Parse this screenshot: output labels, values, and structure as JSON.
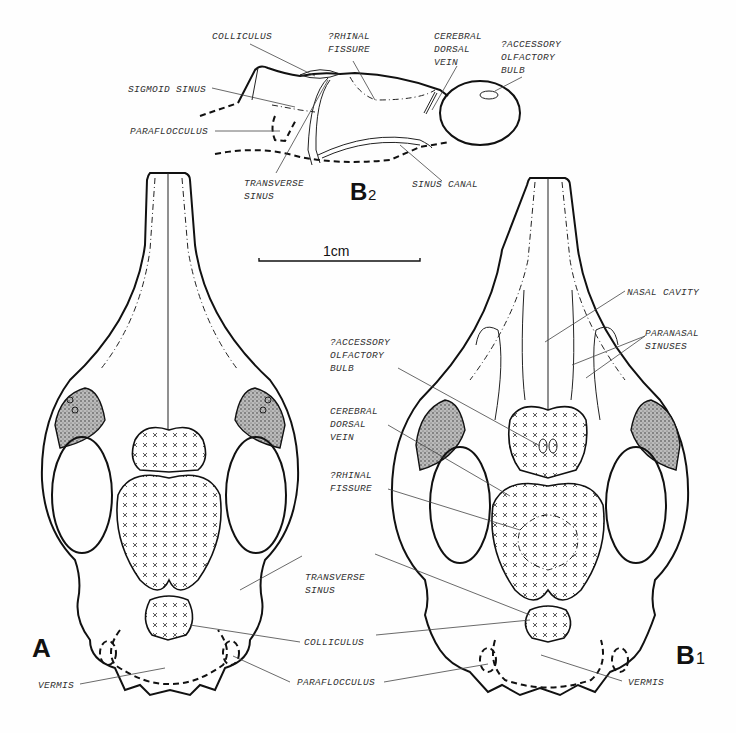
{
  "figure": {
    "panels": {
      "A": {
        "label": "A",
        "view": "dorsal"
      },
      "B1": {
        "label": "B",
        "subscript": "1",
        "view": "dorsal"
      },
      "B2": {
        "label": "B",
        "subscript": "2",
        "view": "lateral"
      }
    },
    "scale_bar": {
      "label": "1cm"
    },
    "labels_B2": {
      "colliculus": "COLLICULUS",
      "rhinal_fissure": [
        "?RHINAL",
        "FISSURE"
      ],
      "cerebral_dorsal_vein": [
        "CEREBRAL",
        "DORSAL",
        "VEIN"
      ],
      "accessory_olfactory_bulb": [
        "?ACCESSORY",
        "OLFACTORY",
        "BULB"
      ],
      "sigmoid_sinus": "SIGMOID SINUS",
      "paraflocculus": "PARAFLOCCULUS",
      "transverse_sinus": [
        "TRANSVERSE",
        "SINUS"
      ],
      "sinus_canal": "SINUS CANAL"
    },
    "labels_B1": {
      "nasal_cavity": "NASAL CAVITY",
      "paranasal_sinuses": [
        "PARANASAL",
        "SINUSES"
      ],
      "accessory_olfactory_bulb": [
        "?ACCESSORY",
        "OLFACTORY",
        "BULB"
      ],
      "cerebral_dorsal_vein": [
        "CEREBRAL",
        "DORSAL",
        "VEIN"
      ],
      "rhinal_fissure": [
        "?RHINAL",
        "FISSURE"
      ],
      "vermis": "VERMIS"
    },
    "labels_shared": {
      "transverse_sinus": [
        "TRANSVERSE",
        "SINUS"
      ],
      "colliculus": "COLLICULUS",
      "paraflocculus": "PARAFLOCCULUS"
    },
    "labels_A": {
      "vermis": "VERMIS"
    }
  }
}
